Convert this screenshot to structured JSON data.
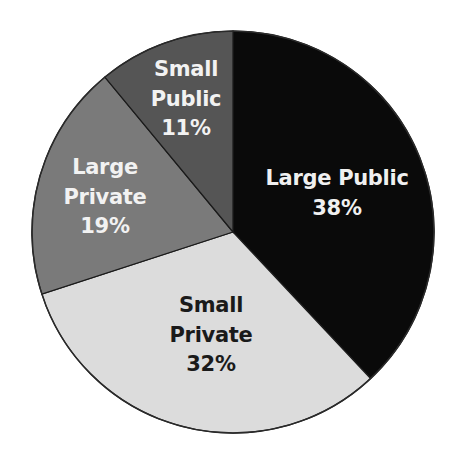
{
  "chart_data": {
    "type": "pie",
    "title": "",
    "start_angle_deg": 0,
    "direction": "clockwise",
    "center": [
      233,
      232
    ],
    "radius": 201,
    "slices": [
      {
        "label": "Large Public",
        "value": 38,
        "display": "38%",
        "color": "#0a0a0a",
        "text_color": "#f0f0f0",
        "label_lines": [
          "Large Public",
          "38%"
        ],
        "label_pos": [
          337,
          177
        ],
        "line_height": 30
      },
      {
        "label": "Small Private",
        "value": 32,
        "display": "32%",
        "color": "#dcdcdc",
        "text_color": "#1a1a1a",
        "label_lines": [
          "Small",
          "Private",
          "32%"
        ],
        "label_pos": [
          211,
          304
        ],
        "line_height": 29.5
      },
      {
        "label": "Large Private",
        "value": 19,
        "display": "19%",
        "color": "#7a7a7a",
        "text_color": "#f2f2f2",
        "label_lines": [
          "Large",
          "Private",
          "19%"
        ],
        "label_pos": [
          105,
          166
        ],
        "line_height": 29.5
      },
      {
        "label": "Small Public",
        "value": 11,
        "display": "11%",
        "color": "#555555",
        "text_color": "#f2f2f2",
        "label_lines": [
          "Small",
          "Public",
          "11%"
        ],
        "label_pos": [
          186,
          68
        ],
        "line_height": 29.5
      }
    ],
    "legend": null,
    "units": "%"
  }
}
